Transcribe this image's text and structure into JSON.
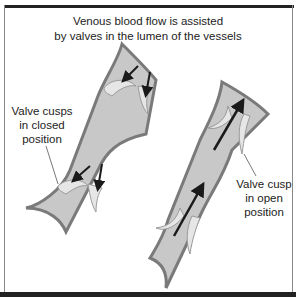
{
  "diagram": {
    "title_line1": "Venous blood flow is assisted",
    "title_line2": "by valves in the lumen of the vessels",
    "labels": {
      "closed": [
        "Valve cusps",
        "in closed",
        "position"
      ],
      "open": [
        "Valve cusp",
        "in open",
        "position"
      ]
    },
    "vessels": [
      {
        "name": "left-vein",
        "state": "valves closed",
        "flow": "backward (downward, blocked)"
      },
      {
        "name": "right-vein",
        "state": "valves open",
        "flow": "forward (upward)"
      }
    ],
    "colors": {
      "vessel_fill": "#c8c8c8",
      "vessel_wall": "#7a7a7a",
      "valve_fill": "#e6e6e6",
      "arrow": "#1a1a1a",
      "frame": "#222222"
    }
  }
}
